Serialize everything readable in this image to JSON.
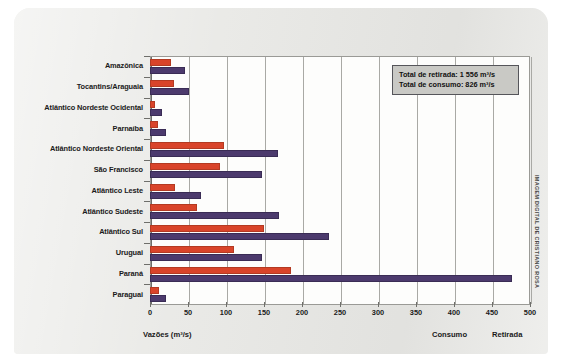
{
  "chart_data": {
    "type": "bar",
    "orientation": "horizontal",
    "title": "",
    "subtitle": "",
    "xlabel": "Vazões (m³/s)",
    "ylabel": "",
    "xlim": [
      0,
      500
    ],
    "xticks": [
      0,
      50,
      100,
      150,
      200,
      250,
      300,
      350,
      400,
      450,
      500
    ],
    "grid": "vertical",
    "legend_position": "bottom-right",
    "categories": [
      "Amazônica",
      "Tocantins/Araguaia",
      "Atlântico Nordeste Ocidental",
      "Parnaíba",
      "Atlântico Nordeste Oriental",
      "São Francisco",
      "Atlântico Leste",
      "Atlântico Sudeste",
      "Atlântico Sul",
      "Uruguai",
      "Paraná",
      "Paraguai"
    ],
    "series": [
      {
        "name": "Consumo",
        "color": "#d9442a",
        "values": [
          28,
          31,
          7,
          11,
          97,
          92,
          33,
          62,
          150,
          110,
          186,
          12
        ]
      },
      {
        "name": "Retirada",
        "color": "#4c3a6d",
        "values": [
          46,
          51,
          16,
          21,
          168,
          147,
          67,
          170,
          235,
          147,
          476,
          21
        ]
      }
    ],
    "annotations": [
      "Total de retirada: 1 556 m³/s",
      "Total de consumo: 826 m³/s"
    ]
  },
  "totals_box": {
    "retirada_label": "Total de retirada: 1 556 m³/s",
    "consumo_label": "Total de consumo: 826 m³/s"
  },
  "captions": {
    "axis_label": "Vazões (m³/s)",
    "consumo": "Consumo",
    "retirada": "Retirada"
  },
  "credit": {
    "text": "IMAGEM DIGITAL DE CRISTIANO ROSA"
  },
  "colors": {
    "consumo": "#d9442a",
    "retirada": "#4c3a6d",
    "panel": "#e9e9e6",
    "plot_background": "#fdfdfc",
    "grid": "#a9a9a5",
    "totals_box_fill": "#c9c9c5"
  }
}
